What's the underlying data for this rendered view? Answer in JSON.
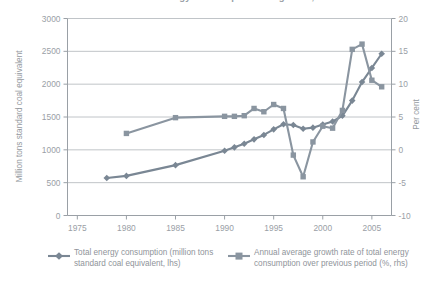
{
  "title": "Chart 1: Total energy consumption and growth, China",
  "axes": {
    "left_title": "Million tons standard coal equivalent",
    "right_title": "Per cent",
    "x_ticks": [
      1975,
      1980,
      1985,
      1990,
      1995,
      2000,
      2005
    ],
    "y_left_ticks": [
      0,
      500,
      1000,
      1500,
      2000,
      2500,
      3000
    ],
    "y_right_ticks": [
      -10,
      -5,
      0,
      5,
      10,
      15,
      20
    ]
  },
  "legend": {
    "items": [
      {
        "marker": "diamond-marker",
        "label": "Total energy consumption (million tons standard coal equivalent, lhs)",
        "color": "#7a8794"
      },
      {
        "marker": "square-marker",
        "label": "Annual average growth rate of total energy consumption over previous period (%, rhs)",
        "color": "#8a95a0"
      }
    ]
  },
  "colors": {
    "series_consumption": "#7a8794",
    "series_growth": "#8a95a0",
    "grid": "#b9bdc2",
    "axis": "#9aa0a6",
    "text": "#9aa0a6"
  },
  "chart_data": {
    "type": "line",
    "title": "Total energy consumption and growth, China",
    "xlabel": "",
    "ylabel": "Million tons standard coal equivalent",
    "ylabel_right": "Per cent",
    "xlim": [
      1974,
      2007
    ],
    "ylim": [
      0,
      3000
    ],
    "ylim_right": [
      -10,
      20
    ],
    "grid": true,
    "legend_position": "below",
    "series": [
      {
        "name": "Total energy consumption (million tons standard coal equivalent, lhs)",
        "axis": "left",
        "marker": "diamond",
        "color": "#7a8794",
        "x": [
          1978,
          1980,
          1985,
          1990,
          1991,
          1992,
          1993,
          1994,
          1995,
          1996,
          1997,
          1998,
          1999,
          2000,
          2001,
          2002,
          2003,
          2004,
          2005,
          2006
        ],
        "y": [
          571,
          603,
          767,
          987,
          1038,
          1092,
          1160,
          1227,
          1312,
          1389,
          1378,
          1322,
          1338,
          1386,
          1432,
          1518,
          1750,
          2032,
          2247,
          2463
        ]
      },
      {
        "name": "Annual average growth rate of total energy consumption over previous period (%, rhs)",
        "axis": "right",
        "marker": "square",
        "color": "#8a95a0",
        "x": [
          1980,
          1985,
          1990,
          1991,
          1992,
          1993,
          1994,
          1995,
          1996,
          1997,
          1998,
          1999,
          2000,
          2001,
          2002,
          2003,
          2004,
          2005,
          2006
        ],
        "y": [
          2.5,
          4.9,
          5.1,
          5.1,
          5.2,
          6.3,
          5.8,
          6.9,
          6.3,
          -0.8,
          -4.1,
          1.2,
          3.6,
          3.3,
          6.0,
          15.3,
          16.1,
          10.6,
          9.6
        ]
      }
    ]
  }
}
